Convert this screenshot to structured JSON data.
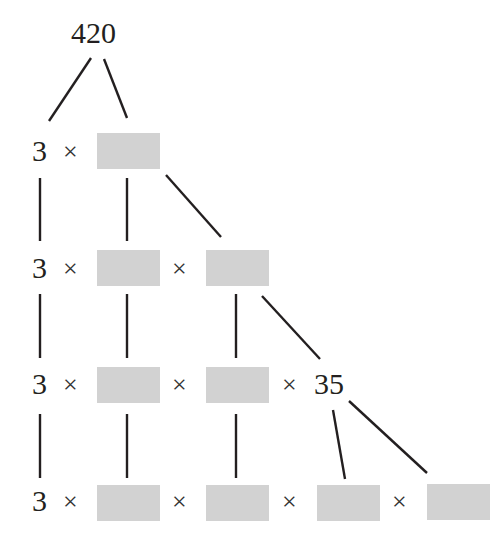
{
  "diagram": {
    "type": "factor-tree",
    "root": "420",
    "times_symbol": "×",
    "rows": [
      {
        "label": "row-1",
        "items": [
          "3",
          "×",
          "[blank]"
        ]
      },
      {
        "label": "row-2",
        "items": [
          "3",
          "×",
          "[blank]",
          "×",
          "[blank]"
        ]
      },
      {
        "label": "row-3",
        "items": [
          "3",
          "×",
          "[blank]",
          "×",
          "[blank]",
          "×",
          "35"
        ]
      },
      {
        "label": "row-4",
        "items": [
          "3",
          "×",
          "[blank]",
          "×",
          "[blank]",
          "×",
          "[blank]",
          "×",
          "[blank]"
        ]
      }
    ],
    "leading_factor": "3",
    "intermediate_value": "35",
    "blank_box_color": "#d2d2d2",
    "line_color": "#231f20"
  }
}
